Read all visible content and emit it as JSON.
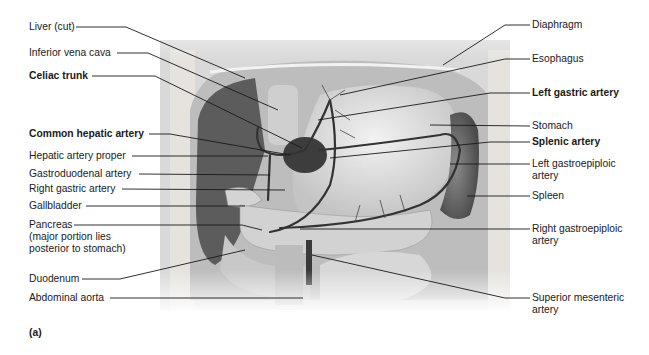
{
  "figure": {
    "tag": "(a)",
    "left_labels": [
      {
        "text": "Liver (cut)",
        "bold": false,
        "x": 29,
        "y": 21
      },
      {
        "text": "Inferior vena cava",
        "bold": false,
        "x": 29,
        "y": 47
      },
      {
        "text": "Celiac trunk",
        "bold": true,
        "x": 29,
        "y": 70
      },
      {
        "text": "Common hepatic artery",
        "bold": true,
        "x": 29,
        "y": 128
      },
      {
        "text": "Hepatic artery proper",
        "bold": false,
        "x": 29,
        "y": 150
      },
      {
        "text": "Gastroduodenal artery",
        "bold": false,
        "x": 29,
        "y": 168
      },
      {
        "text": "Right gastric artery",
        "bold": false,
        "x": 29,
        "y": 183
      },
      {
        "text": "Gallbladder",
        "bold": false,
        "x": 29,
        "y": 200
      },
      {
        "text": "Pancreas",
        "bold": false,
        "x": 29,
        "y": 219
      },
      {
        "text": "(major portion lies",
        "bold": false,
        "x": 29,
        "y": 231
      },
      {
        "text": "posterior to stomach)",
        "bold": false,
        "x": 29,
        "y": 243
      },
      {
        "text": "Duodenum",
        "bold": false,
        "x": 29,
        "y": 273
      },
      {
        "text": "Abdominal aorta",
        "bold": false,
        "x": 29,
        "y": 292
      }
    ],
    "right_labels": [
      {
        "text": "Diaphragm",
        "bold": false,
        "x": 532,
        "y": 19
      },
      {
        "text": "Esophagus",
        "bold": false,
        "x": 532,
        "y": 53
      },
      {
        "text": "Left gastric artery",
        "bold": true,
        "x": 532,
        "y": 87
      },
      {
        "text": "Stomach",
        "bold": false,
        "x": 532,
        "y": 120
      },
      {
        "text": "Splenic artery",
        "bold": true,
        "x": 532,
        "y": 136
      },
      {
        "text": "Left gastroepiploic",
        "bold": false,
        "x": 532,
        "y": 158
      },
      {
        "text": "artery",
        "bold": false,
        "x": 532,
        "y": 170
      },
      {
        "text": "Spleen",
        "bold": false,
        "x": 532,
        "y": 190
      },
      {
        "text": "Right gastroepiploic",
        "bold": false,
        "x": 532,
        "y": 223
      },
      {
        "text": "artery",
        "bold": false,
        "x": 532,
        "y": 235
      },
      {
        "text": "Superior mesenteric",
        "bold": false,
        "x": 532,
        "y": 292
      },
      {
        "text": "artery",
        "bold": false,
        "x": 532,
        "y": 304
      }
    ]
  }
}
